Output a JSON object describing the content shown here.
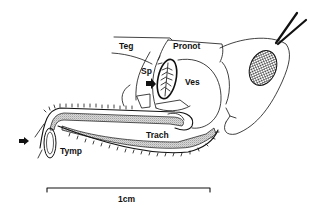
{
  "figure": {
    "labels": {
      "tegmen": "Teg",
      "pronotum": "Pronot",
      "spiracle": "Sp",
      "vesicle": "Ves",
      "trachea": "Trach",
      "tympanum": "Tymp"
    },
    "scale_bar": {
      "label": "1cm"
    },
    "colors": {
      "ink": "#111111",
      "stipple": "#9a9a9a",
      "background": "#ffffff"
    }
  }
}
